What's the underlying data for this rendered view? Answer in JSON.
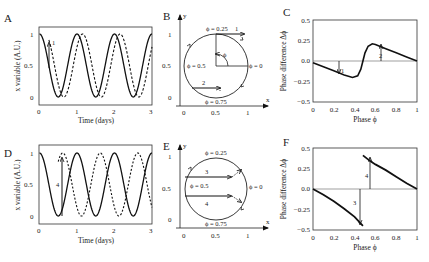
{
  "panels": {
    "A": {
      "label": "A",
      "xlabel": "Time (days)",
      "ylabel": "x variable (A.U.)",
      "xticks": [
        "0",
        "1",
        "2",
        "3"
      ],
      "yticks": [
        "0",
        "0.5",
        "1"
      ],
      "annotation": "1"
    },
    "B": {
      "label": "B",
      "xaxis": "x",
      "yaxis": "y",
      "xticks": [
        "0",
        "0.5",
        "1"
      ],
      "yticks": [
        "0",
        "0.5",
        "1"
      ],
      "phi_025": "ϕ = 0.25",
      "phi_05": "ϕ = 0.5",
      "phi_0": "ϕ = 0",
      "phi_075": "ϕ = 0.75",
      "phi": "ϕ",
      "arrow1": "1",
      "arrow2": "2"
    },
    "C": {
      "label": "C",
      "xlabel": "Phase ϕ",
      "ylabel": "Phase difference Δϕ",
      "xticks": [
        "0",
        "0.2",
        "0.4",
        "0.6",
        "0.8",
        "1"
      ],
      "yticks": [
        "0.5",
        "0.25",
        "0.0",
        "−0.25",
        "−0.5"
      ],
      "arrow1": "1",
      "arrow2": "2"
    },
    "D": {
      "label": "D",
      "xlabel": "Time (days)",
      "ylabel": "x variable (A.U.)",
      "xticks": [
        "0",
        "1",
        "2",
        "3"
      ],
      "yticks": [
        "0",
        "0.5",
        "1"
      ],
      "annotation": "4"
    },
    "E": {
      "label": "E",
      "xaxis": "x",
      "yaxis": "y",
      "xticks": [
        "0",
        "0.5",
        "1"
      ],
      "yticks": [
        "0",
        "0.5",
        "1"
      ],
      "phi_025": "ϕ = 0.25",
      "phi_05": "ϕ = 0.5",
      "phi_0": "ϕ = 0",
      "phi_075": "ϕ = 0.75",
      "arrow3": "3",
      "arrow4": "4"
    },
    "F": {
      "label": "F",
      "xlabel": "Phase ϕ",
      "ylabel": "Phase difference Δϕ",
      "xticks": [
        "0",
        "0.2",
        "0.4",
        "0.6",
        "0.8",
        "1"
      ],
      "yticks": [
        "0.5",
        "0.25",
        "0.0",
        "−0.25",
        "−0.5"
      ],
      "arrow3": "3",
      "arrow4": "4"
    }
  },
  "chart_data": [
    {
      "panel": "A",
      "type": "line",
      "xlabel": "Time (days)",
      "ylabel": "x variable (A.U.)",
      "xlim": [
        0,
        3
      ],
      "ylim": [
        0,
        1
      ],
      "series": [
        {
          "name": "unperturbed (solid)",
          "style": "solid",
          "description": "x = 0.5+0.5cos(2πt), peaks at t=0,1,2,3"
        },
        {
          "name": "perturbed (dashed)",
          "style": "dashed",
          "description": "phase-delayed after small pulse 1 at t≈0.25; peaks at t≈1.15, 2.15"
        }
      ],
      "annotations": [
        {
          "text": "1",
          "x": 0.25,
          "y_from": 0.6,
          "y_to": 0.85
        }
      ]
    },
    {
      "panel": "B",
      "type": "diagram",
      "xlim": [
        0,
        1
      ],
      "ylim": [
        0,
        1
      ],
      "circle": {
        "center": [
          0.5,
          0.5
        ],
        "radius": 0.5
      },
      "labels": [
        "ϕ = 0.25",
        "ϕ = 0.5",
        "ϕ = 0",
        "ϕ = 0.75"
      ],
      "arrows": [
        {
          "label": "1",
          "from": [
            0.5,
            1.0
          ],
          "to": [
            0.9,
            1.0
          ]
        },
        {
          "label": "2",
          "from": [
            0.13,
            0.15
          ],
          "to": [
            0.55,
            0.15
          ]
        }
      ]
    },
    {
      "panel": "C",
      "type": "line",
      "xlabel": "Phase ϕ",
      "ylabel": "Phase difference Δϕ",
      "xlim": [
        0,
        1
      ],
      "ylim": [
        -0.5,
        0.5
      ],
      "x": [
        0,
        0.1,
        0.2,
        0.3,
        0.38,
        0.43,
        0.46,
        0.48,
        0.5,
        0.53,
        0.57,
        0.6,
        0.7,
        0.8,
        0.9,
        1.0
      ],
      "values": [
        -0.02,
        -0.07,
        -0.12,
        -0.17,
        -0.2,
        -0.18,
        -0.1,
        0.0,
        0.1,
        0.18,
        0.21,
        0.2,
        0.15,
        0.1,
        0.05,
        0.0
      ],
      "annotations": [
        {
          "text": "1",
          "x": 0.25
        },
        {
          "text": "2",
          "x": 0.65
        }
      ]
    },
    {
      "panel": "D",
      "type": "line",
      "xlabel": "Time (days)",
      "ylabel": "x variable (A.U.)",
      "xlim": [
        0,
        3
      ],
      "ylim": [
        0,
        1
      ],
      "series": [
        {
          "name": "unperturbed (solid)",
          "style": "solid",
          "description": "peaks at t=0,1,2,3; troughs at 0.5,1.5,2.5"
        },
        {
          "name": "perturbed (dashed)",
          "style": "dashed",
          "description": "reset by large pulse 4 at t≈0.5; peaks at t≈0.62,1.62,2.62"
        }
      ],
      "annotations": [
        {
          "text": "4",
          "x": 0.5,
          "y_from": 0.0,
          "y_to": 0.85
        }
      ]
    },
    {
      "panel": "E",
      "type": "diagram",
      "xlim": [
        0,
        1
      ],
      "ylim": [
        0,
        1
      ],
      "circle": {
        "center": [
          0.5,
          0.5
        ],
        "radius": 0.5
      },
      "labels": [
        "ϕ = 0.25",
        "ϕ = 0.5",
        "ϕ = 0",
        "ϕ = 0.75"
      ],
      "arrows": [
        {
          "label": "3",
          "from": [
            0.0,
            0.65
          ],
          "to": [
            0.75,
            0.65
          ]
        },
        {
          "label": "4",
          "from": [
            0.0,
            0.38
          ],
          "to": [
            0.75,
            0.38
          ]
        }
      ]
    },
    {
      "panel": "F",
      "type": "line",
      "xlabel": "Phase ϕ",
      "ylabel": "Phase difference Δϕ",
      "xlim": [
        0,
        1
      ],
      "ylim": [
        -0.5,
        0.5
      ],
      "series": [
        {
          "name": "branch 1",
          "x": [
            0,
            0.1,
            0.2,
            0.3,
            0.4,
            0.48
          ],
          "values": [
            0,
            -0.07,
            -0.15,
            -0.24,
            -0.34,
            -0.45
          ]
        },
        {
          "name": "branch 2",
          "x": [
            0.48,
            0.55,
            0.6,
            0.7,
            0.8,
            0.9,
            1.0
          ],
          "values": [
            0.41,
            0.34,
            0.3,
            0.23,
            0.15,
            0.07,
            0.0
          ]
        }
      ],
      "annotations": [
        {
          "text": "3",
          "x": 0.45
        },
        {
          "text": "4",
          "x": 0.55
        }
      ]
    }
  ]
}
